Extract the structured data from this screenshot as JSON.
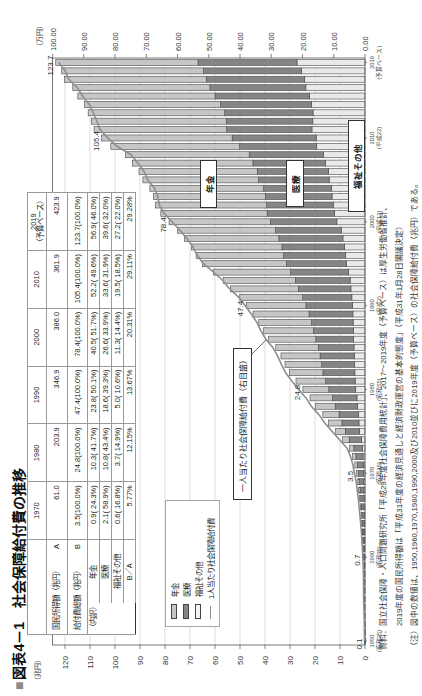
{
  "title": {
    "marker": "■",
    "text": "図表4－1　社会保障給付費の推移"
  },
  "table": {
    "columns": [
      {
        "year": "1970",
        "sub": ""
      },
      {
        "year": "1980",
        "sub": ""
      },
      {
        "year": "1990",
        "sub": ""
      },
      {
        "year": "2000",
        "sub": ""
      },
      {
        "year": "2010",
        "sub": ""
      },
      {
        "year": "2019",
        "sub": "（予算ベース）"
      }
    ],
    "rows": [
      {
        "label": "国民所得額（兆円）",
        "tag": "A",
        "values": [
          "61.0",
          "203.9",
          "346.9",
          "386.0",
          "361.9",
          "423.9"
        ]
      },
      {
        "label": "給付費総額（兆円）",
        "tag": "B",
        "values": [
          "3.5(100.0%)",
          "24.8(100.0%)",
          "47.4(100.0%)",
          "78.4(100.0%)",
          "105.4(100.0%)",
          "123.7(100.0%)"
        ]
      },
      {
        "group": "（内訳）",
        "label": "年金",
        "values": [
          "0.9( 24.3%)",
          "10.3( 41.7%)",
          "23.8( 50.1%)",
          "40.5( 51.7%)",
          "52.2( 49.6%)",
          "56.9( 46.0%)"
        ]
      },
      {
        "label": "医療",
        "values": [
          "2.1( 58.9%)",
          "10.8( 43.4%)",
          "18.6( 39.3%)",
          "26.6( 33.9%)",
          "33.6( 31.9%)",
          "39.6( 32.0%)"
        ]
      },
      {
        "label": "福祉その他",
        "values": [
          "0.6( 16.8%)",
          "3.7( 14.9%)",
          "5.0( 10.6%)",
          "11.3( 14.4%)",
          "19.5( 18.5%)",
          "27.2( 22.0%)"
        ]
      },
      {
        "label": "B／A",
        "values": [
          "5.77%",
          "12.15%",
          "13.67%",
          "20.31%",
          "29.11%",
          "29.28%"
        ]
      }
    ]
  },
  "chart_data": {
    "type": "bar",
    "subtype": "stacked bar with line on secondary axis",
    "title": "社会保障給付費の推移",
    "categories": [
      1950,
      1951,
      1952,
      1953,
      1954,
      1955,
      1956,
      1957,
      1958,
      1959,
      1960,
      1961,
      1962,
      1963,
      1964,
      1965,
      1966,
      1967,
      1968,
      1969,
      1970,
      1971,
      1972,
      1973,
      1974,
      1975,
      1976,
      1977,
      1978,
      1979,
      1980,
      1981,
      1982,
      1983,
      1984,
      1985,
      1986,
      1987,
      1988,
      1989,
      1990,
      1991,
      1992,
      1993,
      1994,
      1995,
      1996,
      1997,
      1998,
      1999,
      2000,
      2001,
      2002,
      2003,
      2004,
      2005,
      2006,
      2007,
      2008,
      2009,
      2010,
      2011,
      2012,
      2013,
      2014,
      2015,
      2016,
      2017,
      2018,
      2019
    ],
    "stack_order_from_base": [
      "福祉その他",
      "医療",
      "年金"
    ],
    "series": [
      {
        "name": "年金",
        "key": "pension",
        "type": "bar",
        "axis": "left",
        "color": "#c6c6c6",
        "values": [
          0.01,
          0.01,
          0.01,
          0.02,
          0.02,
          0.04,
          0.05,
          0.06,
          0.08,
          0.1,
          0.14,
          0.17,
          0.19,
          0.23,
          0.27,
          0.32,
          0.38,
          0.46,
          0.56,
          0.66,
          0.86,
          1.04,
          1.3,
          1.76,
          2.7,
          3.88,
          5.33,
          6.48,
          7.89,
          8.99,
          10.35,
          11.88,
          13.34,
          14.61,
          15.66,
          16.99,
          18.91,
          20.08,
          21.11,
          22.44,
          23.78,
          25.17,
          27.17,
          28.87,
          30.84,
          33.5,
          34.96,
          36.2,
          37.68,
          39.26,
          40.51,
          42.52,
          44.48,
          44.71,
          45.52,
          46.32,
          47.31,
          48.26,
          49.52,
          51.53,
          52.23,
          53.06,
          53.98,
          54.62,
          54.35,
          54.9,
          54.84,
          56.7,
          56.7,
          56.9
        ]
      },
      {
        "name": "医療",
        "key": "medical",
        "type": "bar",
        "axis": "left",
        "color": "#858585",
        "values": [
          0.06,
          0.08,
          0.11,
          0.14,
          0.17,
          0.21,
          0.21,
          0.22,
          0.24,
          0.26,
          0.29,
          0.39,
          0.48,
          0.6,
          0.75,
          0.92,
          1.1,
          1.27,
          1.49,
          1.72,
          2.06,
          2.37,
          2.85,
          3.48,
          4.86,
          5.71,
          6.81,
          7.75,
          8.96,
          9.77,
          10.78,
          11.8,
          12.75,
          13.19,
          13.65,
          14.29,
          15.12,
          15.98,
          16.62,
          17.52,
          18.63,
          19.66,
          21.02,
          21.91,
          23.23,
          24.06,
          24.89,
          25.07,
          25.64,
          26.4,
          26.6,
          26.96,
          26.63,
          26.64,
          27.13,
          28.17,
          28.47,
          28.93,
          29.66,
          30.84,
          33.62,
          34.08,
          34.61,
          35.33,
          36.36,
          37.73,
          38.4,
          39.4,
          39.2,
          39.6
        ]
      },
      {
        "name": "福祉その他",
        "key": "welfare",
        "type": "bar",
        "axis": "left",
        "color": "#e9e9e9",
        "values": [
          0.06,
          0.07,
          0.09,
          0.1,
          0.11,
          0.14,
          0.14,
          0.15,
          0.16,
          0.18,
          0.22,
          0.23,
          0.26,
          0.29,
          0.32,
          0.36,
          0.39,
          0.42,
          0.47,
          0.51,
          0.59,
          0.67,
          0.79,
          1.0,
          1.46,
          2.18,
          2.42,
          2.63,
          2.93,
          3.21,
          3.7,
          3.92,
          4.06,
          4.18,
          4.3,
          4.4,
          4.55,
          4.67,
          4.76,
          4.85,
          5.0,
          5.26,
          5.63,
          5.95,
          6.51,
          7.41,
          7.71,
          8.15,
          8.82,
          9.37,
          11.25,
          12.19,
          12.71,
          13.19,
          13.41,
          14.36,
          14.62,
          15.89,
          16.65,
          19.3,
          19.52,
          21.22,
          20.88,
          20.79,
          21.43,
          22.24,
          23.66,
          24.1,
          25.4,
          27.2
        ]
      },
      {
        "name": "1人当たり社会保障給付費",
        "key": "per-capita",
        "type": "line",
        "axis": "right",
        "color": "#8e8e8e",
        "values": [
          0.16,
          0.19,
          0.24,
          0.3,
          0.34,
          0.44,
          0.44,
          0.47,
          0.52,
          0.58,
          0.7,
          0.84,
          0.98,
          1.16,
          1.38,
          1.63,
          1.89,
          2.15,
          2.49,
          2.82,
          3.39,
          3.88,
          4.61,
          5.73,
          8.16,
          10.52,
          12.87,
          14.76,
          17.17,
          18.91,
          21.2,
          23.41,
          25.4,
          26.76,
          27.96,
          29.49,
          31.7,
          33.33,
          34.6,
          36.37,
          38.36,
          40.4,
          43.3,
          45.49,
          48.46,
          51.73,
          53.66,
          55.01,
          57.03,
          59.22,
          61.75,
          64.26,
          65.84,
          66.31,
          67.34,
          69.52,
          70.68,
          72.72,
          74.81,
          79.43,
          82.26,
          84.79,
          85.79,
          86.99,
          88.23,
          90.38,
          92.05,
          94.79,
          95.89,
          98.02
        ]
      }
    ],
    "left_axis": {
      "label": "（兆円）",
      "range": [
        0,
        125
      ],
      "ticks": [
        "0",
        "10",
        "20",
        "30",
        "40",
        "50",
        "60",
        "70",
        "80",
        "90",
        "100",
        "110",
        "120"
      ]
    },
    "right_axis": {
      "label": "（万円）",
      "range": [
        0,
        100
      ],
      "ticks": [
        "0.00",
        "10.00",
        "20.00",
        "30.00",
        "40.00",
        "50.00",
        "60.00",
        "70.00",
        "80.00",
        "90.00",
        "100.00"
      ]
    },
    "x_tick_labels": [
      {
        "year": 1950,
        "label": "1950",
        "sub": "(昭和25)"
      },
      {
        "year": 1960,
        "label": "1960",
        "sub": "(昭和35)"
      },
      {
        "year": 1970,
        "label": "1970",
        "sub": "(昭和45)"
      },
      {
        "year": 1980,
        "label": "1980",
        "sub": "(昭和55)"
      },
      {
        "year": 1990,
        "label": "1990",
        "sub": "(平成2)"
      },
      {
        "year": 2000,
        "label": "2000",
        "sub": "(平成12)"
      },
      {
        "year": 2010,
        "label": "2010",
        "sub": "(平成22)"
      },
      {
        "year": 2019,
        "label": "2019",
        "sub": "(予算ベース)"
      }
    ],
    "annotations": [
      {
        "year": 1950,
        "text": "0.1"
      },
      {
        "year": 1960,
        "text": "0.7"
      },
      {
        "year": 1970,
        "text": "3.5"
      },
      {
        "year": 1980,
        "text": "24.8"
      },
      {
        "year": 1990,
        "text": "47.4"
      },
      {
        "year": 2000,
        "text": "78.4"
      },
      {
        "year": 2010,
        "text": "105.4"
      },
      {
        "year": 2019,
        "text": "123.7"
      }
    ],
    "segment_labels": {
      "pension": "年金",
      "medical": "医療",
      "welfare": "福祉その他"
    },
    "callout": "一人当たり社会保障給付費（右目盛）",
    "legend": [
      {
        "label": "年金",
        "swatch": "#c6c6c6"
      },
      {
        "label": "医療",
        "swatch": "#858585"
      },
      {
        "label": "福祉その他",
        "swatch": "#e9e9e9"
      },
      {
        "label": "1人当たり社会保障給付費",
        "swatch": "#8e8e8e"
      }
    ],
    "grid": true,
    "legend_position": "inset upper-left"
  },
  "notes": [
    "資料：国立社会保障・人口問題研究所「平成29年度社会保障費用統計」、2017～2019年度（予算ベース）は厚生労働省推計、",
    "2019年度の国民所得額は「平成31年度の経済見通しと経済財政運営の基本的態度」（平成31年1月28日閣議決定）",
    "（注）図中の数値は、1950,1960,1970,1980,1990,2000及び2010並びに2019年度（予算ベース）の社会保障給付費（兆円）である。"
  ]
}
